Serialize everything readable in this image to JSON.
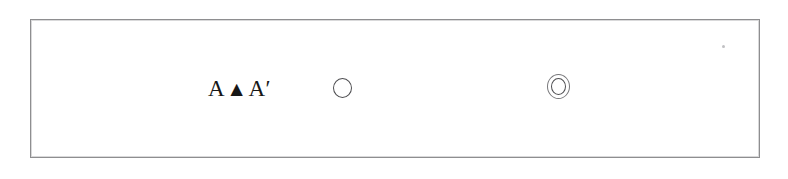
{
  "figure": {
    "frame": {
      "name": "figure-frame",
      "border_color": "#8e8e90",
      "background_color": "#ffffff",
      "left": 30,
      "top": 19,
      "width": 730,
      "height": 139
    },
    "background_color": "#ffffff",
    "symbols": [
      {
        "name": "label-a-triangle-a-prime",
        "kind": "text",
        "text": "A ▲ A′",
        "parts": {
          "left_label": "A",
          "marker": "▲",
          "right_label": "A′"
        },
        "color": "#171717"
      },
      {
        "name": "single-circle-symbol",
        "kind": "circle-outline",
        "glyph": "○",
        "ring_count": 1,
        "color": "#4d4d50"
      },
      {
        "name": "double-circle-symbol",
        "kind": "concentric-circle-outline",
        "glyph": "◎",
        "ring_count": 2,
        "outer_color": "#77777a",
        "inner_color": "#4d4d50"
      }
    ],
    "artifacts": [
      {
        "name": "scan-speck",
        "kind": "scan-noise-dot",
        "color": "#8c8c91"
      }
    ]
  }
}
